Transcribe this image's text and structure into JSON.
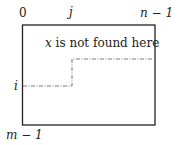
{
  "diagram": {
    "type": "matrix-region",
    "labels": {
      "top_left": "0",
      "top_mid": "j",
      "top_right": "n − 1",
      "left_mid": "i",
      "bottom_left": "m − 1",
      "annotation_var": "x",
      "annotation_rest": " is not found here"
    },
    "colors": {
      "border": "#222222",
      "dashline": "#555555",
      "text": "#222222"
    }
  }
}
